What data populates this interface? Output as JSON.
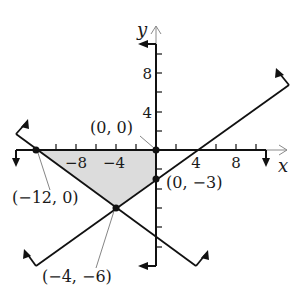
{
  "figure": {
    "axis_labels": {
      "x": "x",
      "y": "y"
    },
    "x_ticks": [
      "−8",
      "−4",
      "4",
      "8"
    ],
    "y_ticks": [
      "8",
      "4"
    ],
    "points": [
      {
        "label": "(0, 0)",
        "x": 0,
        "y": 0
      },
      {
        "label": "(−12, 0)",
        "x": -12,
        "y": 0
      },
      {
        "label": "(0, −3)",
        "x": 0,
        "y": -3
      },
      {
        "label": "(−4, −6)",
        "x": -4,
        "y": -6
      }
    ],
    "shaded_region": "Feasible region bounded by (−12, 0), (0, 0), (0, −3), (−4, −6)",
    "colors": {
      "shade": "#dcdcdc",
      "line": "#1a1a1a",
      "axis": "#8a8a8a"
    }
  }
}
